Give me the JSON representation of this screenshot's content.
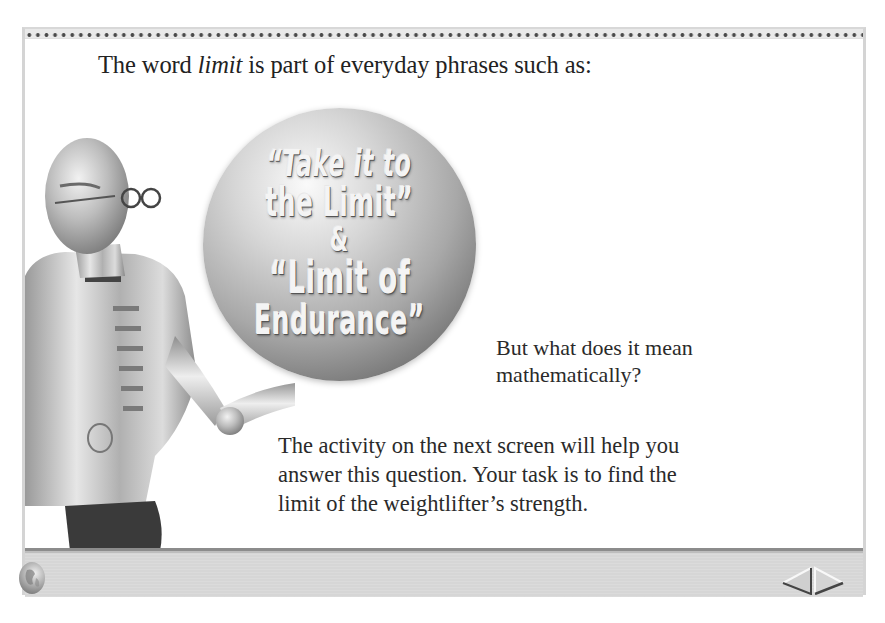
{
  "heading": {
    "prefix": "The word ",
    "emphasis": "limit",
    "suffix": " is part of everyday phrases such as:"
  },
  "sphere": {
    "lines": [
      "“Take it to",
      "the Limit”",
      "&",
      "“Limit of",
      "Endurance”"
    ]
  },
  "question": {
    "line1": "But what does it mean",
    "line2": "mathematically?"
  },
  "activity": {
    "line1": "The activity on the next screen will help you",
    "line2": "answer this question. Your task is to find the",
    "line3": "limit of the weightlifter’s strength."
  },
  "toolbar": {
    "globe_icon": "globe-icon",
    "prev_icon": "left-triangle-arrow",
    "next_icon": "right-triangle-arrow"
  },
  "colors": {
    "background": "#ffffff",
    "toolbar": "#d6d6d6",
    "toolbar_border": "#8c8c8c",
    "text": "#2a2a2a"
  }
}
